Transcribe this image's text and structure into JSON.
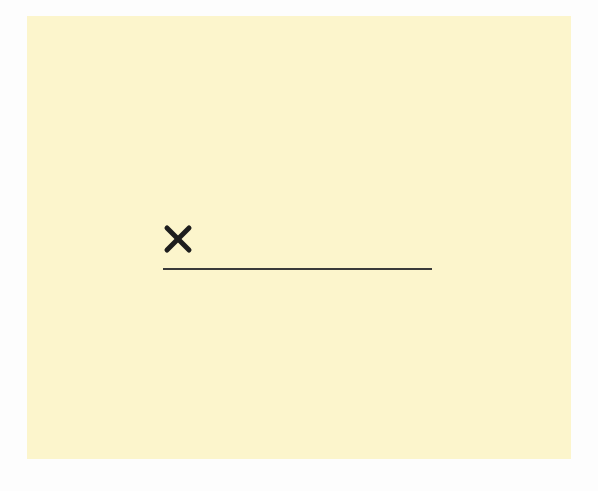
{
  "document": {
    "background_color": "#fcf5cc",
    "page_margin_color": "#fdfdfd"
  },
  "signature_field": {
    "mark_glyph": "×",
    "mark_icon": "x-mark-icon",
    "mark_color": "#1e1e1e",
    "line_color": "#3a3a3a",
    "value": ""
  }
}
